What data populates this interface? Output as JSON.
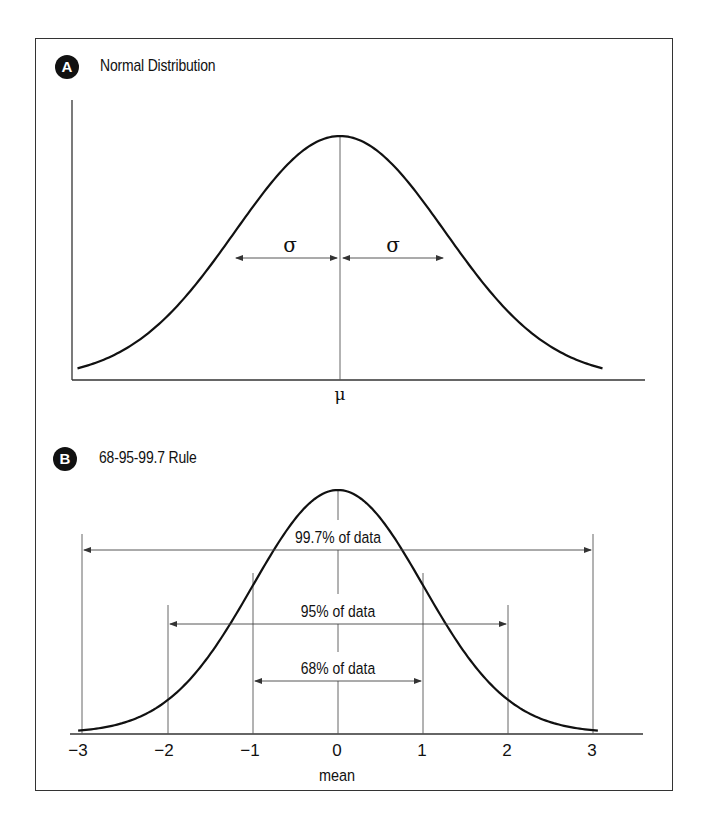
{
  "panels": [
    {
      "badge": "A",
      "title": "Normal Distribution"
    },
    {
      "badge": "B",
      "title": "68-95-99.7 Rule"
    }
  ],
  "colors": {
    "line": "#111111",
    "guide": "#555555",
    "frame": "#333333",
    "badge_bg": "#111111",
    "badge_fg": "#ffffff"
  },
  "chart_data": [
    {
      "type": "line",
      "title": "Normal Distribution",
      "series": [
        {
          "name": "normal pdf",
          "mean": 0,
          "sd": 1,
          "x_range": [
            -2.5,
            2.5
          ]
        }
      ],
      "annotations": [
        {
          "type": "vertical_line",
          "x": 0,
          "label": "μ"
        },
        {
          "type": "double_arrow",
          "from": -1,
          "to": 0,
          "label": "σ"
        },
        {
          "type": "double_arrow",
          "from": 0,
          "to": 1,
          "label": "σ"
        }
      ],
      "xlabel": "",
      "ylabel": "",
      "axis_labels": {
        "center": "μ",
        "sigma": "σ"
      },
      "grid": false
    },
    {
      "type": "line",
      "title": "68-95-99.7 Rule",
      "series": [
        {
          "name": "standard normal pdf",
          "mean": 0,
          "sd": 1,
          "x_range": [
            -3,
            3
          ]
        }
      ],
      "categories": [
        "−3",
        "−2",
        "−1",
        "0",
        "1",
        "2",
        "3"
      ],
      "x_ticks": [
        -3,
        -2,
        -1,
        0,
        1,
        2,
        3
      ],
      "xlabel": "mean",
      "ylabel": "",
      "xlim": [
        -3.15,
        3.6
      ],
      "intervals": [
        {
          "from": -3,
          "to": 3,
          "label": "99.7% of data",
          "percent": 99.7
        },
        {
          "from": -2,
          "to": 2,
          "label": "95% of data",
          "percent": 95
        },
        {
          "from": -1,
          "to": 1,
          "label": "68% of data",
          "percent": 68
        }
      ],
      "grid": false
    }
  ]
}
